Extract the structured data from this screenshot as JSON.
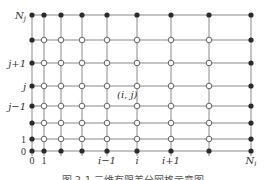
{
  "diagram": {
    "colors": {
      "line": "#8a8a8a",
      "boundary_node": "#2b2b2b",
      "interior_node_fill": "#ffffff",
      "interior_node_stroke": "#555555",
      "text": "#333333"
    },
    "columns_x": [
      32,
      44,
      61,
      82,
      107,
      137,
      171,
      209,
      251
    ],
    "rows_y": [
      151,
      139,
      123,
      106,
      86,
      63,
      40,
      15
    ],
    "x_labels": [
      {
        "text": "0",
        "col": 0,
        "italic": false
      },
      {
        "text": "1",
        "col": 1,
        "italic": false
      },
      {
        "text": "i−1",
        "col": 4,
        "italic": true
      },
      {
        "text": "i",
        "col": 5,
        "italic": true
      },
      {
        "text": "i+1",
        "col": 6,
        "italic": true
      },
      {
        "text": "N_i",
        "col": 8,
        "italic": true
      }
    ],
    "y_labels": [
      {
        "text": "0",
        "row": 0,
        "italic": false
      },
      {
        "text": "1",
        "row": 1,
        "italic": false
      },
      {
        "text": "j−1",
        "row": 3,
        "italic": true
      },
      {
        "text": "j",
        "row": 4,
        "italic": true
      },
      {
        "text": "j+1",
        "row": 5,
        "italic": true
      },
      {
        "text": "N_j",
        "row": 7,
        "italic": true
      }
    ],
    "point_label": "(i, j)",
    "caption": "图 2-1  二维有限差分网格示意图"
  }
}
